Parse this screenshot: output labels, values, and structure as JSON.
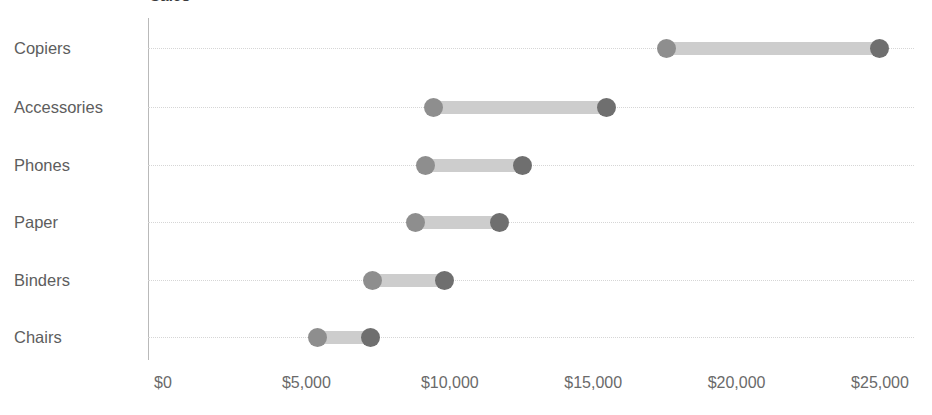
{
  "chart_data": {
    "type": "bar",
    "subtype": "dumbbell-range",
    "title": "Sales",
    "xlabel": "",
    "ylabel": "",
    "xlim": [
      0,
      26500
    ],
    "x_ticks": [
      0,
      5000,
      10000,
      15000,
      20000,
      25000
    ],
    "x_tick_labels": [
      "$0",
      "$5,000",
      "$10,000",
      "$15,000",
      "$20,000",
      "$25,000"
    ],
    "grid": true,
    "grid_style": "dotted-horizontal",
    "legend": null,
    "categories": [
      "Copiers",
      "Accessories",
      "Phones",
      "Paper",
      "Binders",
      "Chairs"
    ],
    "series": [
      {
        "name": "Start",
        "values": [
          17570,
          9420,
          9170,
          8790,
          7290,
          5370
        ]
      },
      {
        "name": "End",
        "values": [
          25000,
          15480,
          12520,
          11750,
          9830,
          7220
        ]
      }
    ],
    "items": [
      {
        "category": "Copiers",
        "start": 17570,
        "end": 25000
      },
      {
        "category": "Accessories",
        "start": 9420,
        "end": 15480
      },
      {
        "category": "Phones",
        "start": 9170,
        "end": 12520
      },
      {
        "category": "Paper",
        "start": 8790,
        "end": 11750
      },
      {
        "category": "Binders",
        "start": 7290,
        "end": 9830
      },
      {
        "category": "Chairs",
        "start": 5370,
        "end": 7220
      }
    ],
    "colors": {
      "start_dot": "#8e8e8e",
      "end_dot": "#6f6f6f",
      "bar": "#cdcdcd",
      "grid": "#d6d6d6",
      "axis": "#b9b9b9",
      "text": "#5d5d5d"
    }
  }
}
